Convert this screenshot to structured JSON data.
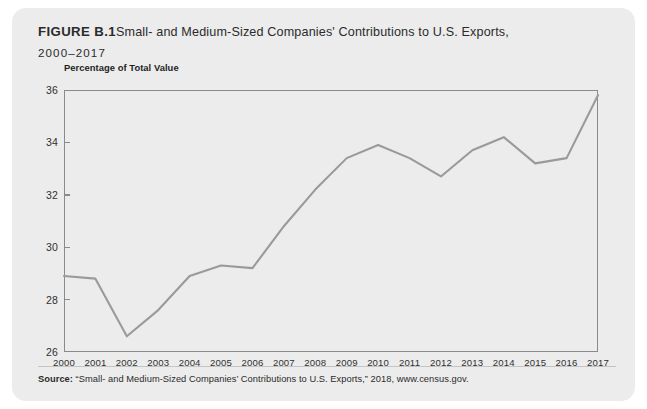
{
  "figure": {
    "label": "FIGURE B.1",
    "title": "Small- and Medium-Sized Companies' Contributions to U.S. Exports,",
    "years_subtitle": "2000–2017"
  },
  "source": {
    "label": "Source:",
    "text": " “Small- and Medium-Sized Companies’ Contributions to U.S. Exports,” 2018, www.census.gov."
  },
  "colors": {
    "card_background": "#ececec",
    "page_background": "#ffffff",
    "line": "#9a9a9a",
    "axis": "#8a8a8a",
    "text": "#2b2b2b",
    "divider": "#c4c4c4"
  },
  "chart_data": {
    "type": "line",
    "title": "Small- and Medium-Sized Companies' Contributions to U.S. Exports, 2000–2017",
    "xlabel": "",
    "ylabel": "Percentage of Total Value",
    "ylim": [
      26,
      36
    ],
    "yticks": [
      26,
      28,
      30,
      32,
      34,
      36
    ],
    "grid": false,
    "legend": "none",
    "categories": [
      "2000",
      "2001",
      "2002",
      "2003",
      "2004",
      "2005",
      "2006",
      "2007",
      "2008",
      "2009",
      "2010",
      "2011",
      "2012",
      "2013",
      "2014",
      "2015",
      "2016",
      "2017"
    ],
    "values": [
      28.9,
      28.8,
      26.6,
      27.6,
      28.9,
      29.3,
      29.2,
      30.8,
      32.2,
      33.4,
      33.9,
      33.4,
      32.7,
      33.7,
      34.2,
      33.2,
      33.4,
      35.8
    ]
  }
}
